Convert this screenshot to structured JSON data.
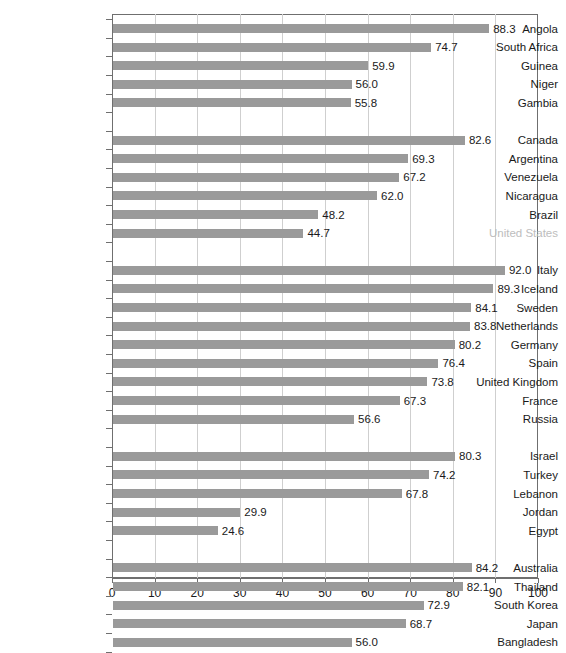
{
  "chart_data": {
    "type": "bar",
    "orientation": "horizontal",
    "title": "",
    "subtitle": "",
    "xlabel": "",
    "ylabel": "",
    "xlim": [
      0,
      100
    ],
    "xticks": [
      0,
      10,
      20,
      30,
      40,
      50,
      60,
      70,
      80,
      90,
      100
    ],
    "grid": "vertical",
    "legend": "none",
    "bar_color": "#9a9a9a",
    "label_color": "#1a1a1a",
    "muted_label_color": "#bdbdbd",
    "value_label_format": "one-decimal",
    "categories": [
      "Angola",
      "South Africa",
      "Guinea",
      "Niger",
      "Gambia",
      "Canada",
      "Argentina",
      "Venezuela",
      "Nicaragua",
      "Brazil",
      "United States",
      "Italy",
      "Iceland",
      "Sweden",
      "Netherlands",
      "Germany",
      "Spain",
      "United Kingdom",
      "France",
      "Russia",
      "Israel",
      "Turkey",
      "Lebanon",
      "Jordan",
      "Egypt",
      "Australia",
      "Thailand",
      "South Korea",
      "Japan",
      "Bangladesh"
    ],
    "values": [
      88.3,
      74.7,
      59.9,
      56.0,
      55.8,
      82.6,
      69.3,
      67.2,
      62.0,
      48.2,
      44.7,
      92.0,
      89.3,
      84.1,
      83.8,
      80.2,
      76.4,
      73.8,
      67.3,
      56.6,
      80.3,
      74.2,
      67.8,
      29.9,
      24.6,
      84.2,
      82.1,
      72.9,
      68.7,
      56.0
    ],
    "groups": [
      {
        "items": [
          {
            "label": "Angola",
            "value": 88.3,
            "muted": false
          },
          {
            "label": "South Africa",
            "value": 74.7,
            "muted": false
          },
          {
            "label": "Guinea",
            "value": 59.9,
            "muted": false
          },
          {
            "label": "Niger",
            "value": 56.0,
            "muted": false
          },
          {
            "label": "Gambia",
            "value": 55.8,
            "muted": false
          }
        ]
      },
      {
        "items": [
          {
            "label": "Canada",
            "value": 82.6,
            "muted": false
          },
          {
            "label": "Argentina",
            "value": 69.3,
            "muted": false
          },
          {
            "label": "Venezuela",
            "value": 67.2,
            "muted": false
          },
          {
            "label": "Nicaragua",
            "value": 62.0,
            "muted": false
          },
          {
            "label": "Brazil",
            "value": 48.2,
            "muted": false
          },
          {
            "label": "United States",
            "value": 44.7,
            "muted": true
          }
        ]
      },
      {
        "items": [
          {
            "label": "Italy",
            "value": 92.0,
            "muted": false
          },
          {
            "label": "Iceland",
            "value": 89.3,
            "muted": false
          },
          {
            "label": "Sweden",
            "value": 84.1,
            "muted": false
          },
          {
            "label": "Netherlands",
            "value": 83.8,
            "muted": false
          },
          {
            "label": "Germany",
            "value": 80.2,
            "muted": false
          },
          {
            "label": "Spain",
            "value": 76.4,
            "muted": false
          },
          {
            "label": "United Kingdom",
            "value": 73.8,
            "muted": false
          },
          {
            "label": "France",
            "value": 67.3,
            "muted": false
          },
          {
            "label": "Russia",
            "value": 56.6,
            "muted": false
          }
        ]
      },
      {
        "items": [
          {
            "label": "Israel",
            "value": 80.3,
            "muted": false
          },
          {
            "label": "Turkey",
            "value": 74.2,
            "muted": false
          },
          {
            "label": "Lebanon",
            "value": 67.8,
            "muted": false
          },
          {
            "label": "Jordan",
            "value": 29.9,
            "muted": false
          },
          {
            "label": "Egypt",
            "value": 24.6,
            "muted": false
          }
        ]
      },
      {
        "items": [
          {
            "label": "Australia",
            "value": 84.2,
            "muted": false
          },
          {
            "label": "Thailand",
            "value": 82.1,
            "muted": false
          },
          {
            "label": "South Korea",
            "value": 72.9,
            "muted": false
          },
          {
            "label": "Japan",
            "value": 68.7,
            "muted": false
          },
          {
            "label": "Bangladesh",
            "value": 56.0,
            "muted": false
          }
        ]
      }
    ]
  }
}
